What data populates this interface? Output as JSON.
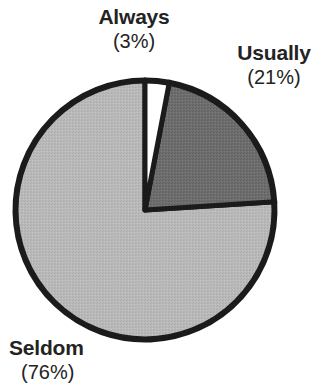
{
  "chart_data": {
    "type": "pie",
    "title": "",
    "subtitle": "",
    "xlabel": "",
    "ylabel": "",
    "legend_position": "none",
    "grid": false,
    "categories": [
      "Always",
      "Usually",
      "Seldom"
    ],
    "values": [
      3,
      21,
      76
    ],
    "unit": "%",
    "start_angle_deg": 0,
    "direction": "clockwise",
    "slices": [
      {
        "label": "Always",
        "value": 3,
        "percent_text": "(3%)",
        "color": "#ffffff",
        "stroke": "#1b1b1b",
        "label_position": "top-center"
      },
      {
        "label": "Usually",
        "value": 21,
        "percent_text": "(21%)",
        "color": "#6e6e6e",
        "stroke": "#1b1b1b",
        "label_position": "top-right"
      },
      {
        "label": "Seldom",
        "value": 76,
        "percent_text": "(76%)",
        "color": "#b9b9b9",
        "stroke": "#1b1b1b",
        "label_position": "bottom-left"
      }
    ],
    "annotations": [
      "Always (3%)",
      "Usually (21%)",
      "Seldom (76%)"
    ]
  },
  "labels": {
    "always": {
      "name": "Always",
      "percent": "(3%)"
    },
    "usually": {
      "name": "Usually",
      "percent": "(21%)"
    },
    "seldom": {
      "name": "Seldom",
      "percent": "(76%)"
    }
  },
  "colors": {
    "background": "#ffffff",
    "outline": "#1b1b1b",
    "text": "#232323",
    "slice_always": "#ffffff",
    "slice_usually": "#6e6e6e",
    "slice_seldom": "#b9b9b9"
  }
}
